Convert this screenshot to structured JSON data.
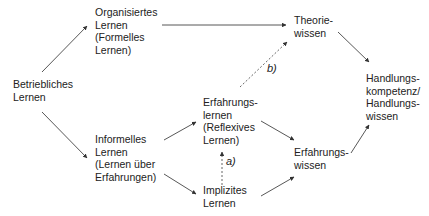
{
  "nodes": {
    "betriebliches": "Betriebliches\nLernen",
    "organisiertes": "Organisiertes\nLernen\n(Formelles\nLernen)",
    "informelles": "Informelles\nLernen\n(Lernen über\nErfahrungen)",
    "theorie": "Theorie-\nwissen",
    "erfahrungslernen": "Erfahrungs-\nlernen\n(Reflexives\nLernen)",
    "implizites": "Implizites\nLernen",
    "erfahrungswissen": "Erfahrungs-\nwissen",
    "handlung": "Handlungs-\nkompetenz/\nHandlungs-\nwissen"
  },
  "edge_labels": {
    "a": "a)",
    "b": "b)"
  },
  "edges": [
    {
      "from": "Betriebliches Lernen",
      "to": "Organisiertes Lernen",
      "style": "solid"
    },
    {
      "from": "Betriebliches Lernen",
      "to": "Informelles Lernen",
      "style": "solid"
    },
    {
      "from": "Organisiertes Lernen",
      "to": "Theoriewissen",
      "style": "solid"
    },
    {
      "from": "Informelles Lernen",
      "to": "Erfahrungslernen",
      "style": "solid"
    },
    {
      "from": "Informelles Lernen",
      "to": "Implizites Lernen",
      "style": "solid"
    },
    {
      "from": "Implizites Lernen",
      "to": "Erfahrungslernen",
      "style": "dashed",
      "label": "a)"
    },
    {
      "from": "Erfahrungslernen",
      "to": "Theoriewissen",
      "style": "dashed",
      "label": "b)"
    },
    {
      "from": "Erfahrungslernen",
      "to": "Erfahrungswissen",
      "style": "solid"
    },
    {
      "from": "Implizites Lernen",
      "to": "Erfahrungswissen",
      "style": "solid"
    },
    {
      "from": "Theoriewissen",
      "to": "Handlungskompetenz/Handlungswissen",
      "style": "solid"
    },
    {
      "from": "Erfahrungswissen",
      "to": "Handlungskompetenz/Handlungswissen",
      "style": "solid"
    }
  ]
}
